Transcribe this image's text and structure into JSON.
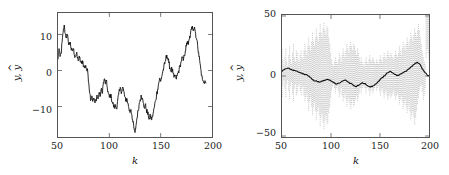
{
  "figure": {
    "background": "#ffffff",
    "trace_color": "#111111",
    "envelope_color": "#9a9a9a",
    "axis_color": "#555555"
  },
  "panels": [
    {
      "id": "left",
      "xlabel": "k",
      "ylabel_main": "y",
      "ylabel_hat": "y",
      "ylabel_sep": ", ",
      "ylabel_hat_mark": "^",
      "xticks": [
        "50",
        "100",
        "150",
        "200"
      ],
      "yticks": [
        "10",
        "0",
        "−10"
      ]
    },
    {
      "id": "right",
      "xlabel": "k",
      "ylabel_main": "y",
      "ylabel_hat": "y",
      "ylabel_sep": ", ",
      "ylabel_hat_mark": "^",
      "xticks": [
        "50",
        "100",
        "150",
        "200"
      ],
      "yticks": [
        "50",
        "0",
        "−50"
      ]
    }
  ],
  "chart_data": [
    {
      "type": "line",
      "panel": "left",
      "title": "",
      "xlabel": "k",
      "ylabel": "y, ŷ",
      "xlim": [
        50,
        200
      ],
      "ylim": [
        -17.5,
        13.5
      ],
      "xticks": [
        50,
        100,
        150,
        200
      ],
      "yticks": [
        10,
        0,
        -10
      ],
      "grid": false,
      "legend": null,
      "series": [
        {
          "name": "y, ŷ (overlaid output and estimate)",
          "color": "#111111",
          "x": [
            50,
            51,
            52,
            53,
            54,
            55,
            56,
            57,
            58,
            59,
            60,
            61,
            62,
            63,
            64,
            65,
            66,
            67,
            68,
            69,
            70,
            71,
            72,
            73,
            74,
            75,
            76,
            77,
            78,
            79,
            80,
            81,
            82,
            83,
            84,
            85,
            86,
            87,
            88,
            89,
            90,
            91,
            92,
            93,
            94,
            95,
            96,
            97,
            98,
            99,
            100,
            101,
            102,
            103,
            104,
            105,
            106,
            107,
            108,
            109,
            110,
            111,
            112,
            113,
            114,
            115,
            116,
            117,
            118,
            119,
            120,
            121,
            122,
            123,
            124,
            125,
            126,
            127,
            128,
            129,
            130,
            131,
            132,
            133,
            134,
            135,
            136,
            137,
            138,
            139,
            140,
            141,
            142,
            143,
            144,
            145,
            146,
            147,
            148,
            149,
            150,
            151,
            152,
            153,
            154,
            155,
            156,
            157,
            158,
            159,
            160,
            161,
            162,
            163,
            164,
            165,
            166,
            167,
            168,
            169,
            170,
            171,
            172,
            173,
            174,
            175,
            176,
            177,
            178,
            179,
            180,
            181,
            182,
            183,
            184,
            185,
            186,
            187,
            188,
            189,
            190,
            191,
            192,
            193,
            194,
            195,
            196,
            197,
            198,
            199,
            200
          ],
          "y": [
            2.0,
            4.6,
            2.6,
            3.3,
            6.2,
            8.6,
            10.5,
            8.4,
            7.5,
            8.0,
            6.4,
            5.6,
            6.2,
            4.2,
            4.0,
            4.6,
            3.0,
            2.6,
            3.4,
            2.2,
            1.8,
            2.4,
            1.2,
            0.9,
            1.6,
            0.2,
            -0.2,
            0.4,
            -0.8,
            -1.2,
            -4.0,
            -6.6,
            -8.2,
            -7.2,
            -8.6,
            -7.8,
            -9.0,
            -8.2,
            -7.0,
            -8.0,
            -6.4,
            -7.4,
            -5.6,
            -6.6,
            -4.4,
            -3.0,
            -4.2,
            -3.4,
            -5.2,
            -6.6,
            -7.6,
            -6.8,
            -7.8,
            -8.8,
            -9.6,
            -10.2,
            -9.6,
            -10.4,
            -8.6,
            -7.0,
            -6.0,
            -5.4,
            -6.2,
            -5.0,
            -6.0,
            -7.4,
            -8.6,
            -7.8,
            -9.0,
            -10.2,
            -11.4,
            -10.6,
            -12.0,
            -13.8,
            -15.4,
            -16.4,
            -14.6,
            -12.6,
            -11.0,
            -9.4,
            -8.2,
            -7.0,
            -7.8,
            -9.0,
            -10.2,
            -9.4,
            -10.6,
            -11.4,
            -12.2,
            -13.0,
            -12.2,
            -13.2,
            -12.4,
            -11.2,
            -9.8,
            -8.4,
            -7.0,
            -5.6,
            -4.2,
            -2.8,
            -3.6,
            -2.4,
            -1.2,
            -0.2,
            0.8,
            2.0,
            3.0,
            2.2,
            1.0,
            -0.2,
            -1.0,
            -0.4,
            -1.6,
            -2.6,
            -2.0,
            -3.0,
            -2.2,
            -1.4,
            -0.6,
            0.4,
            1.4,
            2.4,
            1.6,
            2.8,
            4.0,
            5.2,
            6.4,
            5.6,
            7.0,
            8.2,
            9.4,
            10.2,
            9.4,
            10.0,
            8.4,
            7.0,
            5.4,
            3.6,
            1.6,
            -0.4,
            -2.2,
            -3.4,
            -4.0,
            -3.4,
            -4.0
          ]
        }
      ]
    },
    {
      "type": "line",
      "panel": "right",
      "title": "",
      "xlabel": "k",
      "ylabel": "y, ŷ",
      "xlim": [
        50,
        200
      ],
      "ylim": [
        -57,
        52
      ],
      "xticks": [
        50,
        100,
        150,
        200
      ],
      "yticks": [
        50,
        0,
        -50
      ],
      "grid": false,
      "legend": null,
      "series": [
        {
          "name": "ŷ (oscillatory estimate)",
          "color": "#9a9a9a",
          "description": "high-frequency oscillation whose envelope swells near k=88 and k=188",
          "envelope_upper": [
            22,
            12,
            6,
            14,
            22,
            10,
            6,
            16,
            24,
            12,
            8,
            18,
            26,
            14,
            10,
            20,
            18,
            12,
            10,
            16,
            20,
            14,
            12,
            20,
            26,
            20,
            16,
            24,
            32,
            24,
            20,
            28,
            36,
            28,
            24,
            32,
            40,
            32,
            28,
            36,
            44,
            36,
            32,
            40,
            45,
            38,
            34,
            42,
            40,
            32,
            26,
            18,
            12,
            8,
            6,
            10,
            14,
            10,
            8,
            12,
            18,
            14,
            10,
            16,
            22,
            18,
            14,
            20,
            26,
            22,
            18,
            24,
            28,
            24,
            20,
            26,
            24,
            20,
            16,
            22,
            18,
            14,
            10,
            14,
            10,
            8,
            6,
            10,
            14,
            10,
            8,
            12,
            16,
            12,
            10,
            14,
            12,
            10,
            8,
            12,
            10,
            8,
            12,
            16,
            12,
            10,
            14,
            18,
            14,
            12,
            16,
            20,
            16,
            14,
            18,
            16,
            14,
            12,
            16,
            20,
            16,
            14,
            18,
            24,
            20,
            16,
            22,
            28,
            24,
            20,
            26,
            32,
            28,
            24,
            30,
            36,
            32,
            28,
            34,
            40,
            36,
            32,
            38,
            44,
            38,
            32,
            26,
            20,
            14,
            10,
            8,
            14,
            22,
            18,
            12
          ],
          "envelope_lower": [
            -22,
            -12,
            -6,
            -14,
            -22,
            -10,
            -6,
            -16,
            -24,
            -12,
            -8,
            -18,
            -26,
            -14,
            -10,
            -20,
            -18,
            -12,
            -10,
            -16,
            -20,
            -14,
            -12,
            -20,
            -26,
            -22,
            -18,
            -26,
            -34,
            -26,
            -22,
            -30,
            -38,
            -30,
            -26,
            -34,
            -42,
            -34,
            -30,
            -38,
            -48,
            -40,
            -36,
            -44,
            -50,
            -42,
            -38,
            -46,
            -44,
            -36,
            -30,
            -22,
            -16,
            -12,
            -10,
            -14,
            -18,
            -14,
            -12,
            -16,
            -22,
            -18,
            -14,
            -20,
            -26,
            -22,
            -18,
            -24,
            -30,
            -26,
            -22,
            -28,
            -32,
            -28,
            -24,
            -30,
            -28,
            -24,
            -20,
            -26,
            -22,
            -18,
            -14,
            -18,
            -14,
            -12,
            -10,
            -14,
            -18,
            -14,
            -12,
            -16,
            -20,
            -16,
            -14,
            -18,
            -16,
            -14,
            -12,
            -16,
            -14,
            -12,
            -16,
            -20,
            -16,
            -14,
            -18,
            -22,
            -18,
            -16,
            -20,
            -24,
            -20,
            -18,
            -22,
            -20,
            -18,
            -16,
            -20,
            -24,
            -20,
            -18,
            -22,
            -28,
            -24,
            -20,
            -26,
            -32,
            -28,
            -24,
            -30,
            -36,
            -32,
            -28,
            -34,
            -42,
            -38,
            -34,
            -40,
            -46,
            -40,
            -34,
            -28,
            -22,
            -16,
            -12,
            -10,
            -16,
            -24,
            -20,
            -14
          ],
          "frequency_cycles_per_sample": 0.33
        },
        {
          "name": "y (smooth mean output)",
          "color": "#111111",
          "x": [
            50,
            52,
            54,
            56,
            58,
            60,
            62,
            64,
            66,
            68,
            70,
            72,
            74,
            76,
            78,
            80,
            82,
            84,
            86,
            88,
            90,
            92,
            94,
            96,
            98,
            100,
            102,
            104,
            106,
            108,
            110,
            112,
            114,
            116,
            118,
            120,
            122,
            124,
            126,
            128,
            130,
            132,
            134,
            136,
            138,
            140,
            142,
            144,
            146,
            148,
            150,
            152,
            154,
            156,
            158,
            160,
            162,
            164,
            166,
            168,
            170,
            172,
            174,
            176,
            178,
            180,
            182,
            184,
            186,
            188,
            190,
            192,
            194,
            196,
            198,
            200
          ],
          "y": [
            1.5,
            3.0,
            4.0,
            4.5,
            3.8,
            3.0,
            2.5,
            2.0,
            1.4,
            0.8,
            0.2,
            -0.5,
            -1.2,
            -2.0,
            -3.0,
            -4.5,
            -6.0,
            -7.0,
            -7.6,
            -8.0,
            -7.6,
            -7.0,
            -6.4,
            -5.6,
            -6.2,
            -7.0,
            -8.0,
            -9.0,
            -9.6,
            -9.0,
            -8.0,
            -7.0,
            -6.2,
            -7.0,
            -8.0,
            -9.0,
            -10.0,
            -11.2,
            -12.0,
            -11.0,
            -9.6,
            -8.4,
            -9.2,
            -10.4,
            -11.6,
            -12.4,
            -12.0,
            -11.0,
            -9.4,
            -7.6,
            -5.8,
            -4.0,
            -2.4,
            -1.0,
            0.4,
            1.6,
            0.6,
            -0.4,
            -1.2,
            -1.8,
            -1.2,
            -0.4,
            0.6,
            1.8,
            3.0,
            4.4,
            6.0,
            7.6,
            9.0,
            9.8,
            8.6,
            6.0,
            3.0,
            0.4,
            -1.4,
            -2.2
          ]
        }
      ]
    }
  ]
}
